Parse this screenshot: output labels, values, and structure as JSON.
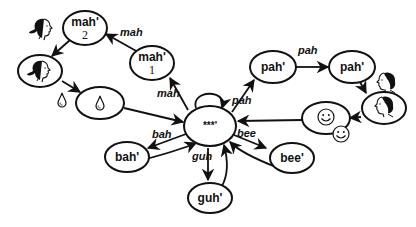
{
  "diagram": {
    "type": "state-transition",
    "colors": {
      "stroke": "#111111",
      "background": "#ffffff"
    },
    "nodes": {
      "center": {
        "label": "***'"
      },
      "mah2": {
        "label": "mah'",
        "sub": "2"
      },
      "mah1": {
        "label": "mah'",
        "sub": "1"
      },
      "woman": {
        "icon": "woman-face-icon"
      },
      "drop": {
        "icon": "water-drop-icon"
      },
      "pah1": {
        "label": "pah'"
      },
      "pah2": {
        "label": "pah'"
      },
      "man": {
        "icon": "man-face-icon"
      },
      "smile": {
        "icon": "smiley-face-icon"
      },
      "bah": {
        "label": "bah'"
      },
      "bee": {
        "label": "bee'"
      },
      "guh": {
        "label": "guh'"
      }
    },
    "edge_labels": {
      "mah_top": "mah",
      "mah_bottom": "mah",
      "pah_top": "pah",
      "pah_center": "pah",
      "bah": "bah",
      "bee": "bee",
      "guh": "guh"
    },
    "side_icons": {
      "woman": "woman-face-icon",
      "drop": "water-drop-icon",
      "man": "man-face-icon",
      "smile": "smiley-face-icon"
    }
  }
}
